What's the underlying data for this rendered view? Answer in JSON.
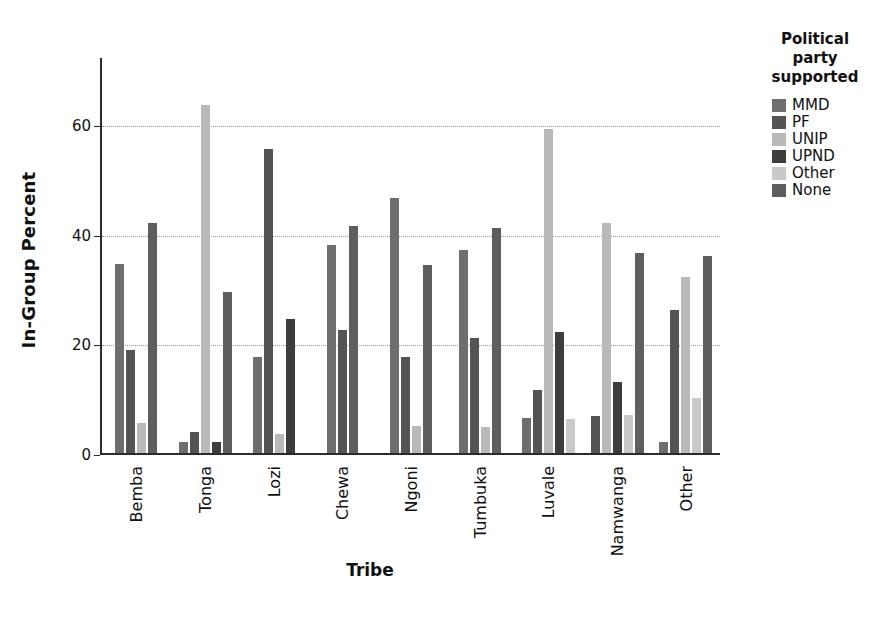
{
  "chart_data": {
    "type": "bar",
    "title": "",
    "xlabel": "Tribe",
    "ylabel": "In-Group Percent",
    "ylim": [
      0,
      72
    ],
    "yticks": [
      0,
      20,
      40,
      60
    ],
    "grid": true,
    "legend_position": "right",
    "legend_title": "Political party supported",
    "categories": [
      "Bemba",
      "Tonga",
      "Lozi",
      "Chewa",
      "Ngoni",
      "Tumbuka",
      "Luvale",
      "Namwanga",
      "Other"
    ],
    "series": [
      {
        "name": "MMD",
        "color": "#6e6e6e",
        "values": [
          34.5,
          2.0,
          17.5,
          38.0,
          46.5,
          37.0,
          6.3,
          0.0,
          2.0
        ]
      },
      {
        "name": "PF",
        "color": "#545454",
        "values": [
          18.8,
          3.8,
          55.5,
          22.5,
          17.5,
          21.0,
          11.5,
          6.8,
          26.0
        ]
      },
      {
        "name": "UNIP",
        "color": "#b9b9b9",
        "values": [
          5.5,
          63.5,
          3.5,
          0.0,
          5.0,
          4.8,
          59.0,
          42.0,
          32.0
        ]
      },
      {
        "name": "UPND",
        "color": "#3d3d3d",
        "values": [
          0.0,
          2.0,
          24.5,
          0.0,
          0.0,
          0.0,
          22.0,
          13.0,
          0.0
        ]
      },
      {
        "name": "Other",
        "color": "#c9c9c9",
        "values": [
          0.0,
          0.0,
          0.0,
          0.0,
          0.0,
          0.0,
          6.2,
          7.0,
          10.0
        ]
      },
      {
        "name": "None",
        "color": "#5e5e5e",
        "values": [
          42.0,
          29.3,
          0.0,
          41.3,
          34.2,
          41.0,
          0.0,
          36.5,
          36.0
        ]
      }
    ]
  },
  "axes": {
    "ylabel": "In-Group Percent",
    "xlabel": "Tribe",
    "ytick_labels": [
      "60",
      "40",
      "20",
      "0"
    ]
  },
  "legend": {
    "title_lines": [
      "Political",
      "party",
      "supported"
    ],
    "items": [
      {
        "label": "MMD",
        "color": "#6e6e6e"
      },
      {
        "label": "PF",
        "color": "#545454"
      },
      {
        "label": "UNIP",
        "color": "#b9b9b9"
      },
      {
        "label": "UPND",
        "color": "#3d3d3d"
      },
      {
        "label": "Other",
        "color": "#c9c9c9"
      },
      {
        "label": "None",
        "color": "#5e5e5e"
      }
    ]
  }
}
